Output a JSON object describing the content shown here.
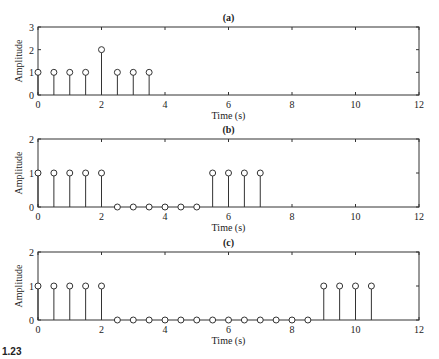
{
  "figure": {
    "caption_fragment": "1.23"
  },
  "chart_data": [
    {
      "type": "stem",
      "title": "(a)",
      "xlabel": "Time (s)",
      "ylabel": "Amplitude",
      "xlim": [
        0,
        12
      ],
      "ylim": [
        0,
        3
      ],
      "xticks": [
        0,
        2,
        4,
        6,
        8,
        10,
        12
      ],
      "yticks": [
        0,
        1,
        2,
        3
      ],
      "grid": false,
      "x": [
        0,
        0.5,
        1,
        1.5,
        2,
        2.5,
        3,
        3.5
      ],
      "values": [
        1,
        1,
        1,
        1,
        2,
        1,
        1,
        1
      ]
    },
    {
      "type": "stem",
      "title": "(b)",
      "xlabel": "Time (s)",
      "ylabel": "Amplitude",
      "xlim": [
        0,
        12
      ],
      "ylim": [
        0,
        2
      ],
      "xticks": [
        0,
        2,
        4,
        6,
        8,
        10,
        12
      ],
      "yticks": [
        0,
        1,
        2
      ],
      "grid": false,
      "x": [
        0,
        0.5,
        1,
        1.5,
        2,
        2.5,
        3,
        3.5,
        4,
        4.5,
        5,
        5.5,
        6,
        6.5,
        7
      ],
      "values": [
        1,
        1,
        1,
        1,
        1,
        0,
        0,
        0,
        0,
        0,
        0,
        1,
        1,
        1,
        1
      ]
    },
    {
      "type": "stem",
      "title": "(c)",
      "xlabel": "Time (s)",
      "ylabel": "Amplitude",
      "xlim": [
        0,
        12
      ],
      "ylim": [
        0,
        2
      ],
      "xticks": [
        0,
        2,
        4,
        6,
        8,
        10,
        12
      ],
      "yticks": [
        0,
        1,
        2
      ],
      "grid": false,
      "x": [
        0,
        0.5,
        1,
        1.5,
        2,
        2.5,
        3,
        3.5,
        4,
        4.5,
        5,
        5.5,
        6,
        6.5,
        7,
        7.5,
        8,
        8.5,
        9,
        9.5,
        10,
        10.5
      ],
      "values": [
        1,
        1,
        1,
        1,
        1,
        0,
        0,
        0,
        0,
        0,
        0,
        0,
        0,
        0,
        0,
        0,
        0,
        0,
        1,
        1,
        1,
        1
      ]
    }
  ]
}
